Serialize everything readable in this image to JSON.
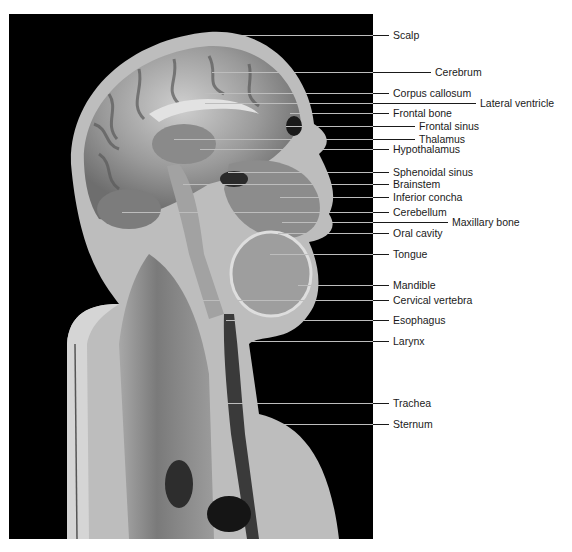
{
  "figure": {
    "type": "sagittal-section-head-neck",
    "photo_background": "#000000",
    "label_color": "#1a1a1a",
    "leader_on_photo_color": "#bdbdbd"
  },
  "labels": [
    {
      "text": "Scalp",
      "y": 35,
      "x_start": 214,
      "label_x": 393
    },
    {
      "text": "Cerebrum",
      "y": 72,
      "x_start": 212,
      "label_x": 435
    },
    {
      "text": "Corpus callosum",
      "y": 93,
      "x_start": 205,
      "label_x": 393
    },
    {
      "text": "Lateral ventricle",
      "y": 103,
      "x_start": 205,
      "label_x": 480
    },
    {
      "text": "Frontal bone",
      "y": 113,
      "x_start": 290,
      "label_x": 393
    },
    {
      "text": "Frontal sinus",
      "y": 126,
      "x_start": 286,
      "label_x": 419
    },
    {
      "text": "Thalamus",
      "y": 139,
      "x_start": 174,
      "label_x": 419
    },
    {
      "text": "Hypothalamus",
      "y": 149,
      "x_start": 200,
      "label_x": 393
    },
    {
      "text": "Sphenoidal sinus",
      "y": 172,
      "x_start": 228,
      "label_x": 393
    },
    {
      "text": "Brainstem",
      "y": 184,
      "x_start": 183,
      "label_x": 393
    },
    {
      "text": "Inferior concha",
      "y": 197,
      "x_start": 280,
      "label_x": 393
    },
    {
      "text": "Cerebellum",
      "y": 212,
      "x_start": 122,
      "label_x": 393
    },
    {
      "text": "Maxillary bone",
      "y": 222,
      "x_start": 282,
      "label_x": 452
    },
    {
      "text": "Oral cavity",
      "y": 233,
      "x_start": 278,
      "label_x": 393
    },
    {
      "text": "Tongue",
      "y": 254,
      "x_start": 270,
      "label_x": 393
    },
    {
      "text": "Mandible",
      "y": 285,
      "x_start": 298,
      "label_x": 393
    },
    {
      "text": "Cervical vertebra",
      "y": 300,
      "x_start": 200,
      "label_x": 393
    },
    {
      "text": "Esophagus",
      "y": 320,
      "x_start": 226,
      "label_x": 393
    },
    {
      "text": "Larynx",
      "y": 341,
      "x_start": 252,
      "label_x": 393
    },
    {
      "text": "Trachea",
      "y": 403,
      "x_start": 228,
      "label_x": 393
    },
    {
      "text": "Sternum",
      "y": 424,
      "x_start": 278,
      "label_x": 393
    }
  ],
  "photo_right_edge": 373
}
